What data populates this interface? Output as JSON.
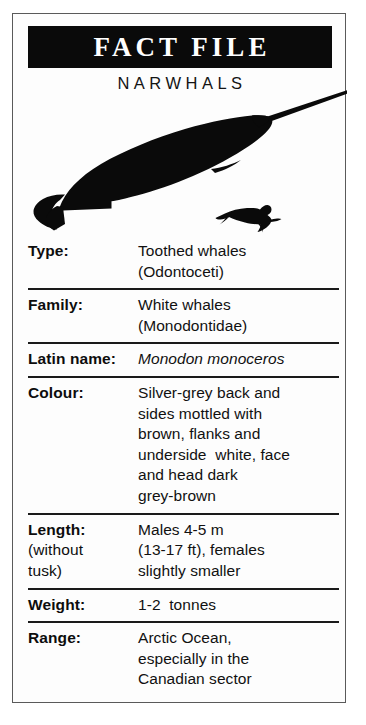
{
  "card": {
    "title": "FACT FILE",
    "subtitle": "NARWHALS",
    "border_color": "#5a5a5a",
    "banner_color": "#0a0a0a",
    "banner_text_color": "#ffffff",
    "text_color": "#111111"
  },
  "illustration": {
    "animal_name": "narwhal-silhouette",
    "scale_figure_name": "diver-silhouette",
    "fill_color": "#0a0a0a"
  },
  "rows": [
    {
      "label": "Type:",
      "label_sub": "",
      "italic": false,
      "value_lines": [
        "Toothed whales",
        "(Odontoceti)"
      ]
    },
    {
      "label": "Family:",
      "label_sub": "",
      "italic": false,
      "value_lines": [
        "White whales",
        "(Monodontidae)"
      ]
    },
    {
      "label": "Latin name:",
      "label_sub": "",
      "italic": true,
      "value_lines": [
        "Monodon monoceros"
      ]
    },
    {
      "label": "Colour:",
      "label_sub": "",
      "italic": false,
      "value_lines": [
        "Silver-grey back and",
        "sides mottled with",
        "brown, flanks and",
        "underside  white, face",
        "and head dark",
        "grey-brown"
      ]
    },
    {
      "label": "Length:",
      "label_sub": "(without\ntusk)",
      "italic": false,
      "value_lines": [
        "Males 4-5 m",
        "(13-17 ft), females",
        "slightly smaller"
      ]
    },
    {
      "label": "Weight:",
      "label_sub": "",
      "italic": false,
      "value_lines": [
        "1-2  tonnes"
      ]
    },
    {
      "label": "Range:",
      "label_sub": "",
      "italic": false,
      "value_lines": [
        "Arctic Ocean,",
        "especially in the",
        "Canadian sector"
      ]
    }
  ]
}
